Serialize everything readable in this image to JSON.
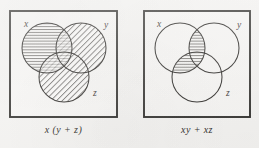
{
  "figure": {
    "type": "venn-diagram-pair",
    "background_color": "#f4f3f1",
    "ink_color": "#2b2926",
    "panels": [
      {
        "id": "left",
        "caption": "x (y + z)",
        "frame": {
          "x": 10,
          "y": 11,
          "width": 107,
          "height": 106
        },
        "circles": [
          {
            "name": "x",
            "label": "x",
            "cx": 47,
            "cy": 48,
            "r": 25,
            "label_x": 24,
            "label_y": 27,
            "fill": "horizontal-hatch"
          },
          {
            "name": "y",
            "label": "y",
            "cx": 81,
            "cy": 48,
            "r": 25,
            "label_x": 104,
            "label_y": 28,
            "fill": "diagonal-hatch"
          },
          {
            "name": "z",
            "label": "z",
            "cx": 64,
            "cy": 77,
            "r": 25,
            "label_x": 93,
            "label_y": 96,
            "fill": "diagonal-hatch"
          }
        ],
        "shaded_description": "x shaded horizontally; y and z shaded diagonally; overlaps cross-hatched"
      },
      {
        "id": "right",
        "caption": "xy + xz",
        "frame": {
          "x": 144,
          "y": 11,
          "width": 106,
          "height": 106
        },
        "circles": [
          {
            "name": "x",
            "label": "x",
            "cx": 180,
            "cy": 48,
            "r": 25,
            "label_x": 157,
            "label_y": 27,
            "fill": "none"
          },
          {
            "name": "y",
            "label": "y",
            "cx": 214,
            "cy": 48,
            "r": 25,
            "label_x": 237,
            "label_y": 28,
            "fill": "none"
          },
          {
            "name": "z",
            "label": "z",
            "cx": 197,
            "cy": 77,
            "r": 25,
            "label_x": 226,
            "label_y": 96,
            "fill": "none"
          }
        ],
        "shaded_description": "only the x-intersect-y lens and the x-intersect-z lens are shaded with horizontal hatch"
      }
    ]
  }
}
